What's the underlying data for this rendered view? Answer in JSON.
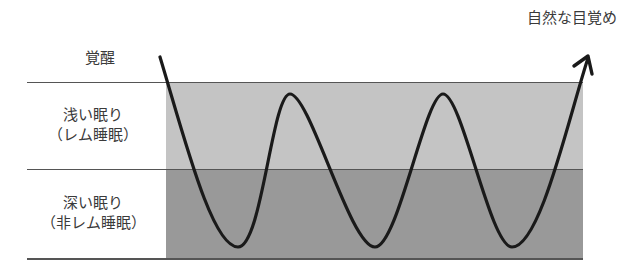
{
  "diagram": {
    "title_type": "sleep-cycle",
    "stages": [
      {
        "id": "awake",
        "label": "覚醒"
      },
      {
        "id": "light",
        "label_line1": "浅い眠り",
        "label_line2": "（レム睡眠）"
      },
      {
        "id": "deep",
        "label_line1": "深い眠り",
        "label_line2": "（非レム睡眠）"
      }
    ],
    "annotation": "自然な目覚め",
    "colors": {
      "light_band": "#c4c4c4",
      "deep_band": "#999999",
      "curve": "#1a1a1a"
    }
  }
}
